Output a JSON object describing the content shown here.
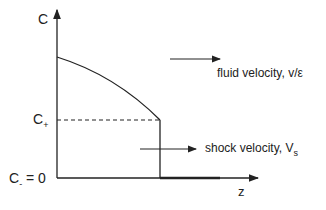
{
  "diagram": {
    "y_axis_label": "C",
    "x_axis_label": "z",
    "c_plus": {
      "main": "C",
      "sub": "+"
    },
    "c_minus": {
      "main": "C",
      "sub": "-",
      "suffix": " = 0"
    },
    "fluid_velocity_label": "fluid velocity, v/ε",
    "shock_velocity_label": {
      "main": "shock velocity, V",
      "sub": "s"
    },
    "line_color": "#222222"
  }
}
